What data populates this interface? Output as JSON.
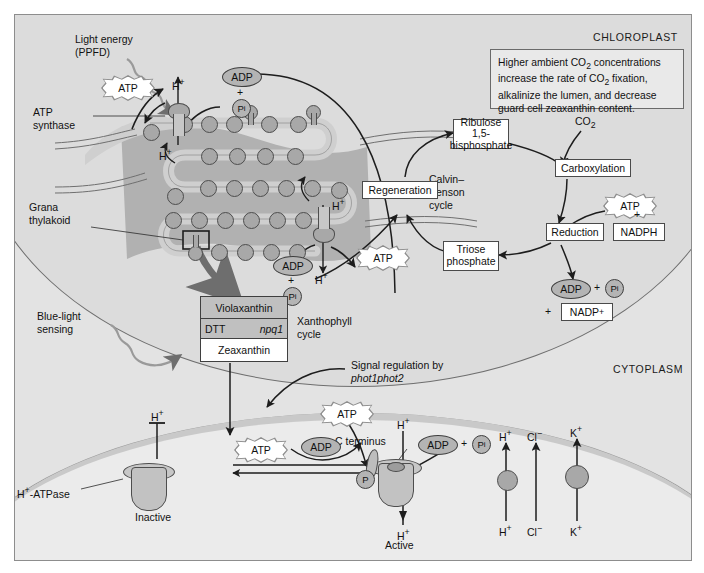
{
  "zones": {
    "chloroplast": "CHLOROPLAST",
    "cytoplasm": "CYTOPLASM"
  },
  "note": {
    "text": "Higher ambient CO2 concentrations increase the rate of CO2 fixation, alkalinize the lumen, and decrease guard cell zeaxanthin content.",
    "line1_a": "Higher ambient CO",
    "line1_sub": "2",
    "line1_b": " concentrations",
    "line2_a": "increase the rate of CO",
    "line2_sub": "2",
    "line2_b": " fixation,",
    "line3": "alkalinize the lumen, and decrease",
    "line4": "guard cell zeaxanthin content."
  },
  "labels": {
    "light_energy_l1": "Light energy",
    "light_energy_l2": "(PPFD)",
    "atp_synthase_l1": "ATP",
    "atp_synthase_l2": "synthase",
    "grana_l1": "Grana",
    "grana_l2": "thylakoid",
    "blue_light_l1": "Blue-light",
    "blue_light_l2": "sensing",
    "xanthophyll_l1": "Xanthophyll",
    "xanthophyll_l2": "cycle",
    "signal_l1": "Signal regulation by",
    "signal_l2": "phot1phot2",
    "calvin_l1": "Calvin–",
    "calvin_l2": "Benson",
    "calvin_l3": "cycle",
    "c_terminus": "C terminus",
    "h_atpase": "H",
    "h_atpase_sup": "+",
    "h_atpase_rest": "-ATPase",
    "inactive": "Inactive",
    "active": "Active"
  },
  "boxes": {
    "rubp_l1": "Ribulose 1,5-",
    "rubp_l2": "bisphosphate",
    "carboxylation": "Carboxylation",
    "regeneration": "Regeneration",
    "reduction": "Reduction",
    "nadph": "NADPH",
    "triose_l1": "Triose",
    "triose_l2": "phosphate",
    "nadp_plus": "NADP",
    "nadp_plus_sup": "+"
  },
  "molecules": {
    "atp": "ATP",
    "adp": "ADP",
    "pi": "P",
    "pi_sub": "i",
    "co2": "CO",
    "co2_sub": "2",
    "plus": "+",
    "h_ion": "H",
    "h_sup": "+",
    "cl_ion": "Cl",
    "cl_sup": "−",
    "k_ion": "K",
    "k_sup": "+",
    "p_circle": "P"
  },
  "xanthophyll": {
    "violaxanthin": "Violaxanthin",
    "zeaxanthin": "Zeaxanthin",
    "dtt": "DTT",
    "npq1": "npq1"
  },
  "ions": {
    "top": [
      "H",
      "Cl",
      "K"
    ],
    "bottom": [
      "H",
      "Cl",
      "K"
    ]
  },
  "colors": {
    "frame_bg": "#e3e3e3",
    "chloroplast_fill": "#dcdcdc",
    "cytoplasm_fill": "#ebebeb",
    "membrane_gray": "#c9c9c9",
    "protein_gray": "#a8a8a8",
    "stroke": "#2a2a2a",
    "box_border": "#4a4a4a"
  }
}
